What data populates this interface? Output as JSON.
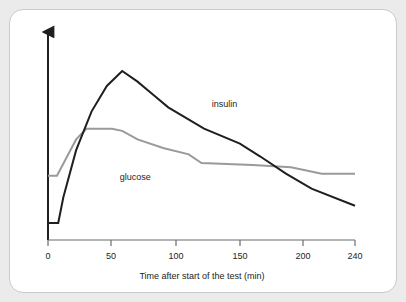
{
  "card": {
    "background_color": "#ffffff",
    "page_background_color": "#ebebeb",
    "border_color": "#c9c9c9"
  },
  "chart_data": {
    "type": "line",
    "title": "",
    "subtitle": "",
    "xlabel": "Time after start of the test (min)",
    "ylabel": "",
    "xlim": [
      0,
      240
    ],
    "ylim": [
      0,
      100
    ],
    "xticks": [
      0,
      50,
      100,
      150,
      200,
      240
    ],
    "xtick_labels": [
      "0",
      "50",
      "100",
      "150",
      "200",
      "240"
    ],
    "yticks": [],
    "ytick_labels": [],
    "grid": false,
    "legend": "inline-annotations",
    "y_axis_arrow": true,
    "series": [
      {
        "name": "insulin",
        "color": "#1f1f1f",
        "stroke_width": 2.0,
        "label_text": "insulin",
        "label_x": 128,
        "label_y": 62,
        "x": [
          0,
          8,
          12,
          22,
          34,
          46,
          58,
          70,
          82,
          94,
          122,
          150,
          166,
          186,
          206,
          240
        ],
        "y": [
          8,
          8,
          20,
          42,
          60,
          72,
          79,
          74,
          68,
          62,
          52,
          45,
          39,
          31,
          24,
          16
        ]
      },
      {
        "name": "glucose",
        "color": "#9a9a9a",
        "stroke_width": 2.0,
        "label_text": "glucose",
        "label_x": 56,
        "label_y": 28,
        "x": [
          0,
          7,
          14,
          22,
          30,
          50,
          58,
          70,
          90,
          110,
          120,
          160,
          190,
          214,
          240
        ],
        "y": [
          30,
          30,
          38,
          47,
          52,
          52,
          51,
          47,
          43,
          40,
          36,
          35,
          34,
          31,
          31
        ]
      }
    ]
  },
  "axis": {
    "x_axis_color": "#6d6d6d",
    "y_axis_color": "#1f1f1f",
    "tick_color": "#6d6d6d"
  }
}
